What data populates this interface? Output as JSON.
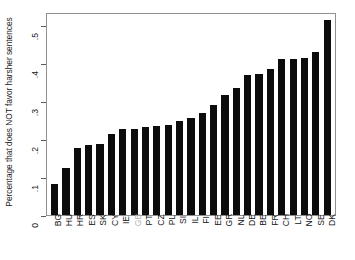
{
  "chart_data": {
    "type": "bar",
    "title": "",
    "xlabel": "",
    "ylabel": "Percentage that does NOT favor harsher sentences",
    "ylim": [
      0,
      0.535
    ],
    "yticks": [
      "0",
      ".1",
      ".2",
      ".3",
      ".4",
      ".5"
    ],
    "ytick_values": [
      0,
      0.1,
      0.2,
      0.3,
      0.4,
      0.5
    ],
    "grid": false,
    "legend": "none",
    "bar_color": "#0c0c0c",
    "highlight_label_color": "#b4b4b4",
    "highlighted_category": "GB",
    "categories": [
      "BG",
      "HU",
      "HR",
      "ES",
      "SK",
      "CY",
      "IE",
      "GB",
      "PT",
      "CZ",
      "PL",
      "SI",
      "IL",
      "FI",
      "EE",
      "GR",
      "NL",
      "DE",
      "BE",
      "FR",
      "CH",
      "LT",
      "NO",
      "SE",
      "DK"
    ],
    "values": [
      0.082,
      0.123,
      0.176,
      0.185,
      0.188,
      0.213,
      0.226,
      0.227,
      0.231,
      0.234,
      0.238,
      0.249,
      0.255,
      0.268,
      0.289,
      0.315,
      0.335,
      0.368,
      0.372,
      0.386,
      0.41,
      0.41,
      0.413,
      0.429,
      0.513
    ]
  },
  "figure": {
    "background": "#ffffff",
    "frame_color": "#8f8f8f"
  }
}
